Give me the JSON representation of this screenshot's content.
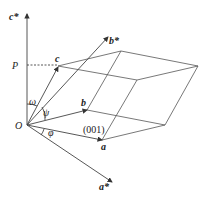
{
  "diagram": {
    "type": "crystal-lattice-vector-geometry",
    "labels": {
      "c_star": "c*",
      "b_star": "b*",
      "a_star": "a*",
      "a": "a",
      "b": "b",
      "c": "c",
      "origin": "O",
      "P": "P",
      "plane": "(001)",
      "omega": "ω",
      "psi": "ψ",
      "phi": "φ"
    },
    "colors": {
      "line": "#444444",
      "text": "#222222",
      "background": "#ffffff"
    }
  }
}
